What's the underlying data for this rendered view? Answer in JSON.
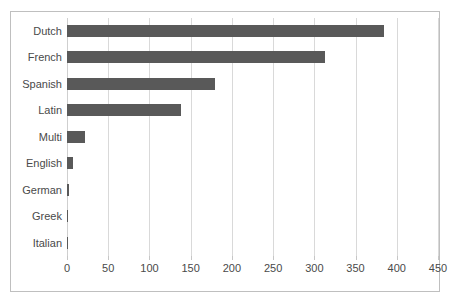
{
  "chart_data": {
    "type": "bar",
    "orientation": "horizontal",
    "title": "",
    "subtitle": "",
    "xlabel": "",
    "ylabel": "",
    "categories": [
      "Dutch",
      "French",
      "Spanish",
      "Latin",
      "Multi",
      "English",
      "German",
      "Greek",
      "Italian"
    ],
    "values": [
      385,
      313,
      179,
      138,
      22,
      7,
      3,
      1,
      1
    ],
    "series": [
      {
        "name": "Count",
        "values": [
          385,
          313,
          179,
          138,
          22,
          7,
          3,
          1,
          1
        ]
      }
    ],
    "xlim": [
      0,
      450
    ],
    "ylim": null,
    "xticks": [
      0,
      50,
      100,
      150,
      200,
      250,
      300,
      350,
      400,
      450
    ],
    "xtick_labels": [
      "0",
      "50",
      "100",
      "150",
      "200",
      "250",
      "300",
      "350",
      "400",
      "450"
    ],
    "grid": "vertical",
    "legend": "none",
    "annotations": [],
    "colors": {
      "bar": "#595959",
      "gridline": "#d9d9d9",
      "border": "#bfbfbf",
      "text": "#4a4a4a",
      "background": "#ffffff"
    }
  }
}
